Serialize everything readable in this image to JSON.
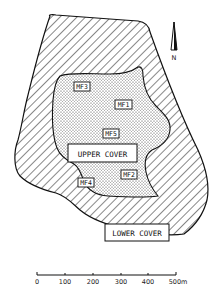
{
  "map": {
    "zones": [
      {
        "id": "upper",
        "label": "UPPER COVER",
        "pattern": "stipple"
      },
      {
        "id": "lower",
        "label": "LOWER COVER",
        "pattern": "diagonal-hatch"
      }
    ],
    "sites": [
      {
        "id": "MF1",
        "label": "MF1"
      },
      {
        "id": "MF2",
        "label": "MF2"
      },
      {
        "id": "MF3",
        "label": "MF3"
      },
      {
        "id": "MF4",
        "label": "MF4"
      },
      {
        "id": "MF5",
        "label": "MF5"
      }
    ],
    "north_arrow": {
      "label": "N"
    },
    "scale_bar": {
      "ticks": [
        "0",
        "100",
        "200",
        "300",
        "400",
        "500m"
      ],
      "unit": "m"
    },
    "colors": {
      "ink": "#111111",
      "background": "#ffffff"
    }
  }
}
